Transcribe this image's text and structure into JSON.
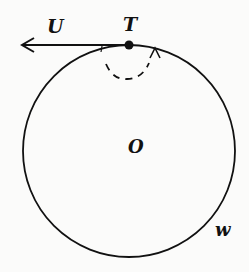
{
  "diagram": {
    "labels": {
      "U": "U",
      "T": "T",
      "O": "O",
      "w": "w"
    },
    "circle": {
      "cx": 129,
      "cy": 151,
      "r": 106
    },
    "colors": {
      "stroke": "#111111",
      "background": "#fbfbfa"
    }
  }
}
